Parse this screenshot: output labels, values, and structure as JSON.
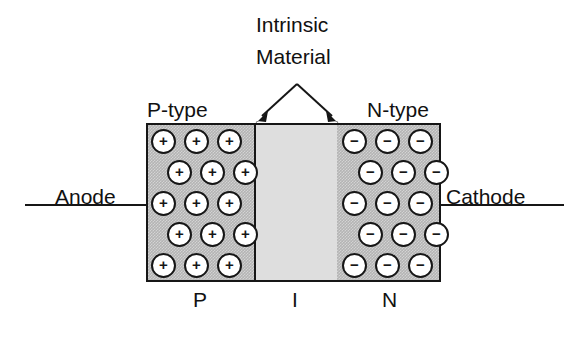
{
  "diagram": {
    "background_color": "#ffffff",
    "ink_color": "#161616",
    "doped_region_color": "#b4b4b4",
    "intrinsic_region_color": "#dedede"
  },
  "callout": {
    "line1": "Intrinsic",
    "line2": "Material",
    "arrow_target_left": "intrinsic region left edge",
    "arrow_target_right": "intrinsic region right edge"
  },
  "labels": {
    "p_type": "P-type",
    "n_type": "N-type",
    "anode": "Anode",
    "cathode": "Cathode"
  },
  "bottom_letters": {
    "p": "P",
    "i": "I",
    "n": "N"
  },
  "regions": [
    {
      "id": "p-region",
      "name": "P-type region",
      "letter": "P",
      "type_label": "P-type",
      "carrier_symbol": "+",
      "carrier_count": 15,
      "fill": "#b4b4b4"
    },
    {
      "id": "i-region",
      "name": "Intrinsic region",
      "letter": "I",
      "type_label": "Intrinsic Material",
      "carrier_symbol": "",
      "carrier_count": 0,
      "fill": "#dedede"
    },
    {
      "id": "n-region",
      "name": "N-type region",
      "letter": "N",
      "type_label": "N-type",
      "carrier_symbol": "−",
      "carrier_count": 15,
      "fill": "#b4b4b4"
    }
  ],
  "carriers": {
    "p_symbol": "+",
    "n_symbol": "−",
    "p_rows": [
      {
        "offset": 0,
        "count": 3
      },
      {
        "offset": 1,
        "count": 3
      },
      {
        "offset": 0,
        "count": 3
      },
      {
        "offset": 1,
        "count": 3
      },
      {
        "offset": 0,
        "count": 3
      }
    ],
    "n_rows": [
      {
        "offset": 0,
        "count": 3
      },
      {
        "offset": 1,
        "count": 3
      },
      {
        "offset": 0,
        "count": 3
      },
      {
        "offset": 1,
        "count": 3
      },
      {
        "offset": 0,
        "count": 3
      }
    ]
  },
  "terminals": [
    {
      "id": "anode",
      "label": "Anode",
      "side": "left"
    },
    {
      "id": "cathode",
      "label": "Cathode",
      "side": "right"
    }
  ]
}
